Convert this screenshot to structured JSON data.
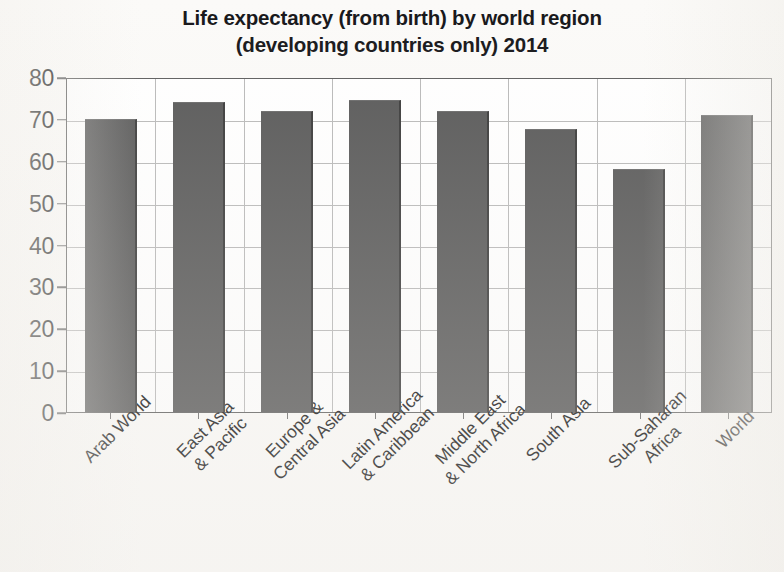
{
  "chart_data": {
    "type": "bar",
    "title": "Life expectancy (from birth) by world region (developing countries only) 2014",
    "title_lines": [
      "Life expectancy (from birth) by world region",
      "(developing countries only) 2014"
    ],
    "xlabel": "",
    "ylabel": "",
    "ylim": [
      0,
      80
    ],
    "ytick_step": 10,
    "yticks": [
      80,
      70,
      60,
      50,
      40,
      30,
      20,
      10,
      0
    ],
    "grid": true,
    "legend": false,
    "bar_color": "#595959",
    "categories": [
      "Arab World",
      "East Asia & Pacific",
      "Europe & Central Asia",
      "Latin America & Caribbean",
      "Middle East & North Africa",
      "South Asia",
      "Sub-Saharan Africa",
      "World"
    ],
    "category_lines": [
      [
        "Arab World",
        ""
      ],
      [
        "East Asia",
        "& Pacific"
      ],
      [
        "Europe &",
        "Central Asia"
      ],
      [
        "Latin America",
        "& Caribbean"
      ],
      [
        "Middle East",
        "& North Africa"
      ],
      [
        "South Asia",
        ""
      ],
      [
        "Sub-Saharan",
        "Africa"
      ],
      [
        "World",
        ""
      ]
    ],
    "values": [
      70,
      74,
      72,
      74.5,
      72,
      67.5,
      58,
      71
    ]
  }
}
